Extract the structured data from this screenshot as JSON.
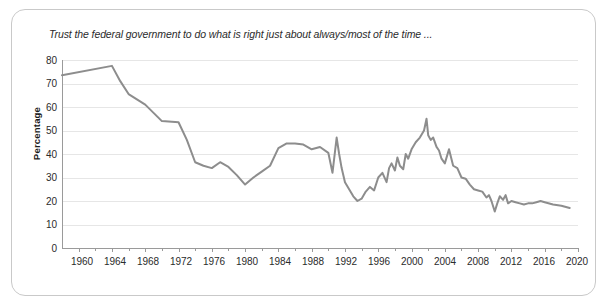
{
  "figure": {
    "title": "Trust the federal government to do what is right just about always/most of the time ...",
    "border_color": "#c9c9c9",
    "background": "#ffffff"
  },
  "axes": {
    "ylabel": "Percentage",
    "ytick_labels": [
      "80",
      "70",
      "60",
      "50",
      "40",
      "30",
      "20",
      "10",
      "0"
    ],
    "xtick_labels": [
      "1960",
      "1964",
      "1968",
      "1972",
      "1976",
      "1980",
      "1984",
      "1988",
      "1992",
      "1996",
      "2000",
      "2004",
      "2008",
      "2012",
      "2016",
      "2020"
    ]
  },
  "chart_data": {
    "type": "line",
    "title": "Trust the federal government to do what is right just about always/most of the time ...",
    "xlabel": "",
    "ylabel": "Percentage",
    "xlim": [
      1958,
      2020
    ],
    "ylim": [
      0,
      80
    ],
    "xticks": [
      1960,
      1964,
      1968,
      1972,
      1976,
      1980,
      1984,
      1988,
      1992,
      1996,
      2000,
      2004,
      2008,
      2012,
      2016,
      2020
    ],
    "yticks": [
      0,
      10,
      20,
      30,
      40,
      50,
      60,
      70,
      80
    ],
    "minor_xtick_interval": 2,
    "grid": "horizontal",
    "legend": "none",
    "line_color": "#8d8d8d",
    "line_width": 2.0,
    "series": [
      {
        "name": "Trust the federal government (always/most of the time)",
        "x": [
          1958,
          1964,
          1965,
          1966,
          1968,
          1970,
          1972,
          1973,
          1974,
          1975,
          1976,
          1977,
          1978,
          1979,
          1980,
          1981,
          1982,
          1983,
          1984,
          1985,
          1986,
          1987,
          1988,
          1989,
          1990,
          1990.5,
          1991,
          1991.3,
          1991.6,
          1992,
          1992.5,
          1993,
          1993.5,
          1994,
          1994.5,
          1995,
          1995.5,
          1996,
          1996.5,
          1997,
          1997.3,
          1997.6,
          1998,
          1998.3,
          1998.6,
          1999,
          1999.3,
          1999.6,
          2000,
          2000.5,
          2001,
          2001.5,
          2001.8,
          2002,
          2002.3,
          2002.6,
          2003,
          2003.3,
          2003.6,
          2004,
          2004.5,
          2005,
          2005.5,
          2006,
          2006.5,
          2007,
          2007.5,
          2008,
          2008.5,
          2009,
          2009.3,
          2009.6,
          2010,
          2010.3,
          2010.6,
          2011,
          2011.3,
          2011.6,
          2012,
          2012.5,
          2013,
          2013.5,
          2014,
          2014.5,
          2015,
          2015.5,
          2016,
          2017,
          2018,
          2019
        ],
        "y": [
          73.5,
          77.5,
          71,
          65.5,
          61,
          54,
          53.5,
          46,
          36.5,
          35,
          34,
          36.5,
          34.5,
          31,
          27,
          30,
          32.5,
          35,
          42.5,
          44.5,
          44.5,
          44,
          42,
          43,
          40.5,
          32,
          47,
          40,
          34,
          28,
          25,
          22,
          20,
          21,
          24,
          26,
          24.5,
          30,
          32,
          28,
          34,
          36,
          33,
          38.5,
          35,
          33.5,
          40,
          38,
          42,
          45,
          47,
          50,
          55,
          48,
          46,
          47,
          43,
          41.5,
          38,
          36,
          42,
          35,
          34,
          30,
          29.5,
          27,
          25,
          24.5,
          24,
          21.5,
          22.5,
          20,
          15.5,
          19,
          22,
          20.5,
          22.5,
          19,
          20,
          19.5,
          19,
          18.5,
          19,
          19,
          19.5,
          20,
          19.5,
          18.5,
          18,
          17
        ]
      }
    ],
    "notable_points": [
      {
        "year": 1964,
        "value": 77.5,
        "note": "peak trust"
      },
      {
        "year": 1980,
        "value": 27,
        "note": "late-1970s trough"
      },
      {
        "year": 1991,
        "value": 47,
        "note": "Gulf War spike"
      },
      {
        "year": 1993.5,
        "value": 20,
        "note": "early-1990s trough"
      },
      {
        "year": 2001.8,
        "value": 55,
        "note": "post-9/11 peak"
      },
      {
        "year": 2010,
        "value": 15.5,
        "note": "record low"
      },
      {
        "year": 2019,
        "value": 17,
        "note": "final value"
      }
    ]
  }
}
